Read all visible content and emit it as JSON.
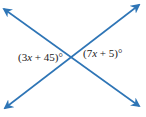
{
  "diagram": {
    "type": "vertical-angles",
    "line_color": "#2E75B6",
    "lines": [
      {
        "name": "line-a",
        "from": [
          4,
          9
        ],
        "to": [
          139,
          106
        ],
        "arrows": "both"
      },
      {
        "name": "line-b",
        "from": [
          5,
          108
        ],
        "to": [
          139,
          5
        ],
        "arrows": "both"
      }
    ],
    "intersection": [
      72,
      57
    ],
    "labels": {
      "left": {
        "open": "(3",
        "var": "x",
        "rest": " + 45)°"
      },
      "right": {
        "open": "(7",
        "var": "x",
        "rest": " + 5)°"
      }
    }
  }
}
